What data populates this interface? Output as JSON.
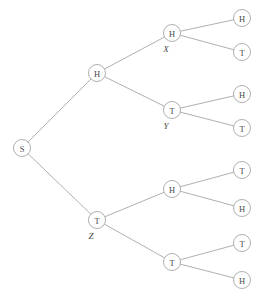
{
  "figure": {
    "background_color": "#ffffff",
    "line_color": "#9a9a9a",
    "text_color": "#4a4a4a",
    "node_radius": 8.5,
    "width": 267,
    "height": 298
  },
  "chart_data": {
    "type": "diagram",
    "subtype": "binary-tree",
    "title": "",
    "levels": 4,
    "leaf_count": 8,
    "leaf_sequence": [
      "H",
      "T",
      "H",
      "T",
      "T",
      "H",
      "T",
      "H"
    ],
    "annotations": [
      "X",
      "Y",
      "Z"
    ]
  },
  "nodes": [
    {
      "id": "s",
      "label": "S",
      "annotation": "",
      "x": 22,
      "y": 148,
      "depth": 0
    },
    {
      "id": "h1",
      "label": "H",
      "annotation": "",
      "x": 97,
      "y": 73,
      "depth": 1
    },
    {
      "id": "t1",
      "label": "T",
      "annotation": "Z",
      "x": 97,
      "y": 220,
      "depth": 1
    },
    {
      "id": "hh",
      "label": "H",
      "annotation": "X",
      "x": 172,
      "y": 33,
      "depth": 2
    },
    {
      "id": "ht",
      "label": "T",
      "annotation": "Y",
      "x": 172,
      "y": 110,
      "depth": 2
    },
    {
      "id": "th",
      "label": "H",
      "annotation": "",
      "x": 172,
      "y": 189,
      "depth": 2
    },
    {
      "id": "tt",
      "label": "T",
      "annotation": "",
      "x": 172,
      "y": 262,
      "depth": 2
    },
    {
      "id": "leaf1",
      "label": "H",
      "annotation": "",
      "x": 242,
      "y": 18,
      "depth": 3
    },
    {
      "id": "leaf2",
      "label": "T",
      "annotation": "",
      "x": 242,
      "y": 52,
      "depth": 3
    },
    {
      "id": "leaf3",
      "label": "H",
      "annotation": "",
      "x": 242,
      "y": 94,
      "depth": 3
    },
    {
      "id": "leaf4",
      "label": "T",
      "annotation": "",
      "x": 242,
      "y": 128,
      "depth": 3
    },
    {
      "id": "leaf5",
      "label": "T",
      "annotation": "",
      "x": 242,
      "y": 170,
      "depth": 3
    },
    {
      "id": "leaf6",
      "label": "H",
      "annotation": "",
      "x": 242,
      "y": 208,
      "depth": 3
    },
    {
      "id": "leaf7",
      "label": "T",
      "annotation": "",
      "x": 242,
      "y": 243,
      "depth": 3
    },
    {
      "id": "leaf8",
      "label": "H",
      "annotation": "",
      "x": 242,
      "y": 280,
      "depth": 3
    }
  ],
  "edges": [
    {
      "from": "s",
      "to": "h1"
    },
    {
      "from": "s",
      "to": "t1"
    },
    {
      "from": "h1",
      "to": "hh"
    },
    {
      "from": "h1",
      "to": "ht"
    },
    {
      "from": "t1",
      "to": "th"
    },
    {
      "from": "t1",
      "to": "tt"
    },
    {
      "from": "hh",
      "to": "leaf1"
    },
    {
      "from": "hh",
      "to": "leaf2"
    },
    {
      "from": "ht",
      "to": "leaf3"
    },
    {
      "from": "ht",
      "to": "leaf4"
    },
    {
      "from": "th",
      "to": "leaf5"
    },
    {
      "from": "th",
      "to": "leaf6"
    },
    {
      "from": "tt",
      "to": "leaf7"
    },
    {
      "from": "tt",
      "to": "leaf8"
    }
  ]
}
